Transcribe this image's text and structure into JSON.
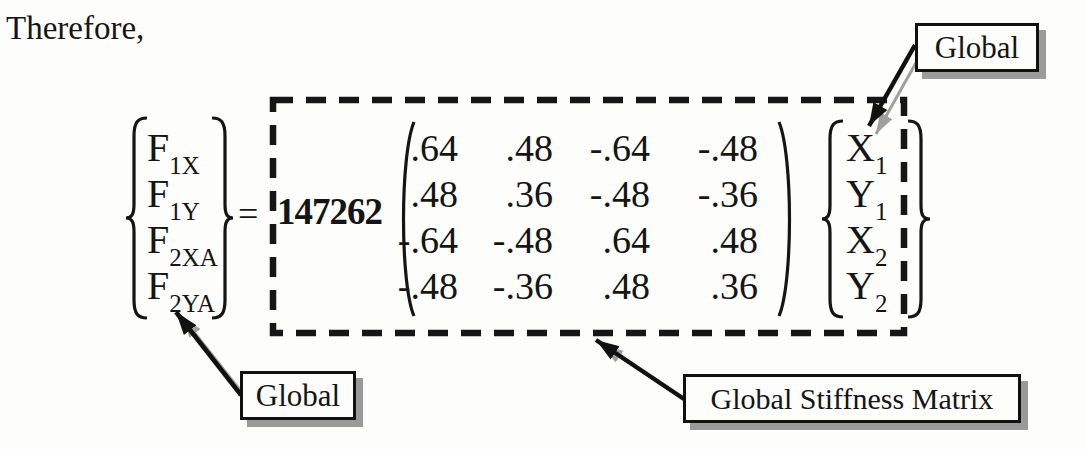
{
  "intro_text": "Therefore,",
  "equation": {
    "equals": "=",
    "scalar": "147262",
    "force_vector": {
      "entries": [
        {
          "base": "F",
          "sub": "1X"
        },
        {
          "base": "F",
          "sub": "1Y"
        },
        {
          "base": "F",
          "sub": "2XA"
        },
        {
          "base": "F",
          "sub": "2YA"
        }
      ]
    },
    "matrix": {
      "rows": [
        [
          ".64",
          ".48",
          "-.64",
          "-.48"
        ],
        [
          ".48",
          ".36",
          "-.48",
          "-.36"
        ],
        [
          "-.64",
          "-.48",
          ".64",
          ".48"
        ],
        [
          "-.48",
          "-.36",
          ".48",
          ".36"
        ]
      ]
    },
    "displacement_vector": {
      "entries": [
        {
          "base": "X",
          "sub": "1"
        },
        {
          "base": "Y",
          "sub": "1"
        },
        {
          "base": "X",
          "sub": "2"
        },
        {
          "base": "Y",
          "sub": "2"
        }
      ]
    }
  },
  "annotations": {
    "global_top": {
      "label": "Global"
    },
    "global_bottom": {
      "label": "Global"
    },
    "stiffness": {
      "label": "Global Stiffness Matrix"
    }
  },
  "colors": {
    "ink": "#151515",
    "dashed_outline": "#161616",
    "arrow": "#111111",
    "arrow_shadow": "#a0a0a0",
    "callout_border": "#111111",
    "callout_shadow": "#9a9a9a",
    "background": "#fdfdfb"
  }
}
